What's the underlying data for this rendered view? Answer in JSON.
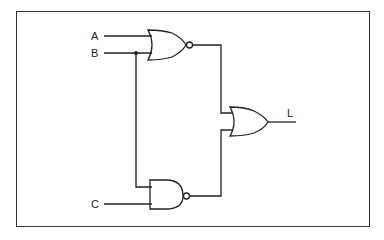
{
  "diagram": {
    "type": "logic-circuit",
    "inputs": [
      {
        "label": "A"
      },
      {
        "label": "B"
      },
      {
        "label": "C"
      }
    ],
    "output": {
      "label": "L"
    },
    "gates": [
      {
        "id": "g1",
        "type": "NOR",
        "inputs": [
          "A",
          "B"
        ]
      },
      {
        "id": "g2",
        "type": "NAND",
        "inputs": [
          "B",
          "C"
        ]
      },
      {
        "id": "g3",
        "type": "OR",
        "inputs": [
          "g1",
          "g2"
        ],
        "output": "L"
      }
    ],
    "colors": {
      "stroke": "#222222",
      "background": "#ffffff"
    }
  }
}
